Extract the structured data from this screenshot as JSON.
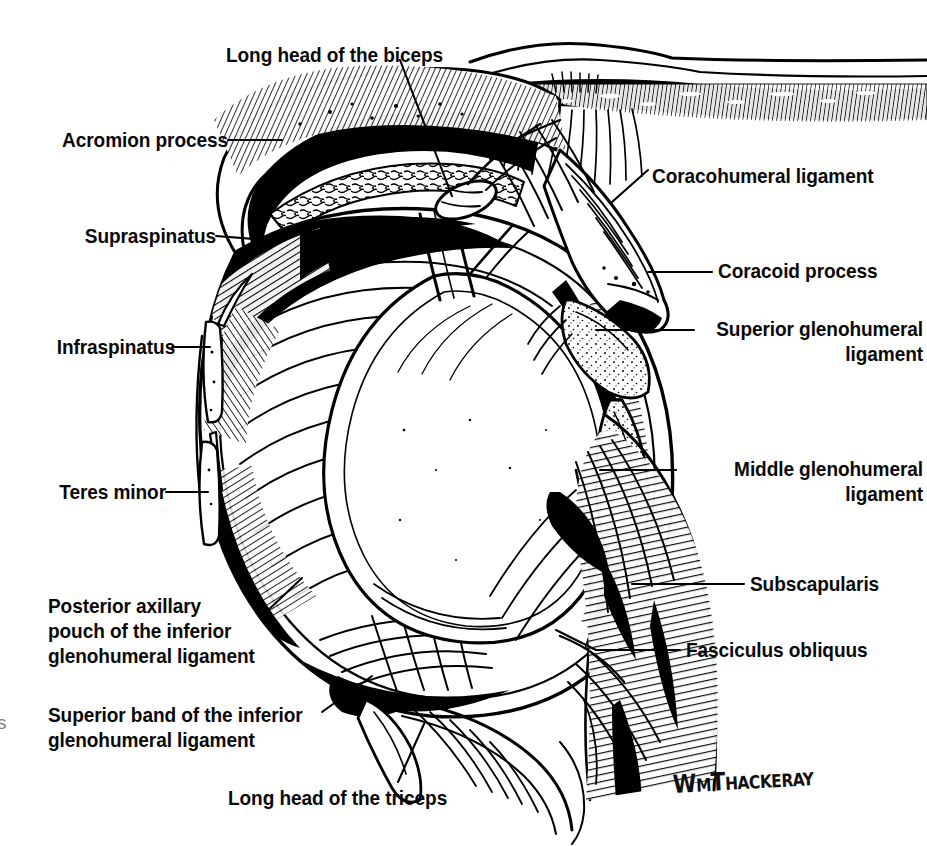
{
  "figure": {
    "style": "pen-and-ink line drawing",
    "background_color": "#ffffff",
    "ink_color": "#000000",
    "artist_signature": "WmThackeray"
  },
  "labels": {
    "long_head_biceps": "Long head of the biceps",
    "acromion_process": "Acromion process",
    "supraspinatus": "Supraspinatus",
    "infraspinatus": "Infraspinatus",
    "teres_minor": "Teres minor",
    "posterior_axillary_pouch_l1": "Posterior axillary",
    "posterior_axillary_pouch_l2": "pouch of the inferior",
    "posterior_axillary_pouch_l3": "glenohumeral ligament",
    "superior_band_l1": "Superior band of the inferior",
    "superior_band_l2": "glenohumeral ligament",
    "long_head_triceps": "Long head of the triceps",
    "coracohumeral_ligament": "Coracohumeral ligament",
    "coracoid_process": "Coracoid process",
    "superior_glenohumeral_l1": "Superior glenohumeral",
    "superior_glenohumeral_l2": "ligament",
    "middle_glenohumeral_l1": "Middle glenohumeral",
    "middle_glenohumeral_l2": "ligament",
    "subscapularis": "Subscapularis",
    "fasciculus_obliquus": "Fasciculus obliquus"
  },
  "edge_artifact": "s"
}
